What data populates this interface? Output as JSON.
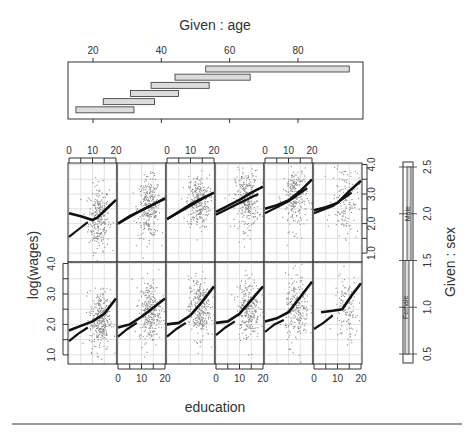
{
  "chart_data": {
    "type": "scatter",
    "subtype": "coplot",
    "title": "",
    "xlabel": "education",
    "ylabel": "log(wages)",
    "xlim": [
      0,
      20
    ],
    "ylim": [
      0.7,
      4.05
    ],
    "x_ticks": [
      0,
      10,
      20
    ],
    "y_ticks": [
      1.0,
      2.0,
      3.0,
      4.0
    ],
    "grid": true,
    "given": [
      {
        "name": "age",
        "label": "Given : age",
        "axis_ticks": [
          20,
          40,
          60,
          80
        ],
        "intervals": [
          [
            15,
            32
          ],
          [
            23,
            38
          ],
          [
            31,
            45
          ],
          [
            37,
            54
          ],
          [
            44,
            66
          ],
          [
            53,
            95
          ]
        ]
      },
      {
        "name": "sex",
        "label": "Given : sex",
        "axis_ticks": [
          0.5,
          1.0,
          1.5,
          2.0,
          2.5
        ],
        "levels": [
          {
            "label": "Female",
            "interval": [
              0.5,
              1.5
            ]
          },
          {
            "label": "Male",
            "interval": [
              1.5,
              2.5
            ]
          }
        ]
      }
    ],
    "panels": [
      {
        "row": "Male",
        "age": [
          15,
          32
        ],
        "cloud": {
          "cx": 12.5,
          "cy": 2.2,
          "sx": 2.2,
          "sy": 0.55,
          "n": 260
        },
        "smooth": [
          [
            0,
            2.35
          ],
          [
            5,
            2.25
          ],
          [
            10,
            2.12
          ],
          [
            12,
            2.2
          ],
          [
            16,
            2.5
          ],
          [
            20,
            2.8
          ]
        ],
        "fit": [
          [
            0,
            1.55
          ],
          [
            4,
            1.8
          ],
          [
            8,
            2.05
          ]
        ]
      },
      {
        "row": "Male",
        "age": [
          23,
          38
        ],
        "cloud": {
          "cx": 13,
          "cy": 2.55,
          "sx": 2.4,
          "sy": 0.5,
          "n": 280
        },
        "smooth": [
          [
            0,
            2.0
          ],
          [
            5,
            2.25
          ],
          [
            10,
            2.45
          ],
          [
            15,
            2.65
          ],
          [
            20,
            2.85
          ]
        ],
        "fit": [
          [
            0,
            2.0
          ],
          [
            10,
            2.45
          ],
          [
            20,
            2.85
          ]
        ]
      },
      {
        "row": "Male",
        "age": [
          31,
          45
        ],
        "cloud": {
          "cx": 13,
          "cy": 2.75,
          "sx": 2.4,
          "sy": 0.45,
          "n": 280
        },
        "smooth": [
          [
            0,
            2.15
          ],
          [
            5,
            2.4
          ],
          [
            10,
            2.65
          ],
          [
            15,
            2.85
          ],
          [
            20,
            3.05
          ]
        ],
        "fit": [
          [
            0,
            2.15
          ],
          [
            10,
            2.6
          ],
          [
            16,
            2.9
          ]
        ]
      },
      {
        "row": "Male",
        "age": [
          37,
          54
        ],
        "cloud": {
          "cx": 13,
          "cy": 2.8,
          "sx": 2.5,
          "sy": 0.5,
          "n": 280
        },
        "smooth": [
          [
            0,
            2.4
          ],
          [
            5,
            2.6
          ],
          [
            10,
            2.8
          ],
          [
            15,
            3.05
          ],
          [
            20,
            3.25
          ]
        ],
        "fit": [
          [
            0,
            2.3
          ],
          [
            10,
            2.7
          ],
          [
            18,
            3.0
          ]
        ]
      },
      {
        "row": "Male",
        "age": [
          44,
          66
        ],
        "cloud": {
          "cx": 12.5,
          "cy": 2.9,
          "sx": 2.6,
          "sy": 0.55,
          "n": 250
        },
        "smooth": [
          [
            0,
            2.5
          ],
          [
            5,
            2.62
          ],
          [
            10,
            2.78
          ],
          [
            15,
            3.1
          ],
          [
            20,
            3.5
          ]
        ],
        "fit": [
          [
            0,
            2.35
          ],
          [
            10,
            2.75
          ],
          [
            18,
            3.2
          ]
        ]
      },
      {
        "row": "Male",
        "age": [
          53,
          95
        ],
        "cloud": {
          "cx": 13,
          "cy": 2.85,
          "sx": 2.8,
          "sy": 0.6,
          "n": 140
        },
        "smooth": [
          [
            0,
            2.45
          ],
          [
            5,
            2.55
          ],
          [
            10,
            2.7
          ],
          [
            15,
            3.1
          ],
          [
            20,
            3.45
          ]
        ],
        "fit": [
          [
            0,
            2.35
          ],
          [
            8,
            2.6
          ],
          [
            16,
            3.05
          ]
        ]
      },
      {
        "row": "Female",
        "age": [
          15,
          32
        ],
        "cloud": {
          "cx": 13,
          "cy": 2.15,
          "sx": 2.2,
          "sy": 0.5,
          "n": 300
        },
        "smooth": [
          [
            0,
            1.8
          ],
          [
            5,
            1.95
          ],
          [
            10,
            2.1
          ],
          [
            15,
            2.35
          ],
          [
            20,
            2.85
          ]
        ],
        "fit": [
          [
            0,
            1.45
          ],
          [
            4,
            1.7
          ],
          [
            8,
            1.9
          ]
        ]
      },
      {
        "row": "Female",
        "age": [
          23,
          38
        ],
        "cloud": {
          "cx": 13.5,
          "cy": 2.45,
          "sx": 2.3,
          "sy": 0.5,
          "n": 290
        },
        "smooth": [
          [
            0,
            1.9
          ],
          [
            5,
            2.0
          ],
          [
            10,
            2.25
          ],
          [
            15,
            2.55
          ],
          [
            20,
            2.85
          ]
        ],
        "fit": [
          [
            0,
            1.6
          ],
          [
            4,
            1.85
          ],
          [
            8,
            2.05
          ]
        ]
      },
      {
        "row": "Female",
        "age": [
          31,
          45
        ],
        "cloud": {
          "cx": 13.5,
          "cy": 2.55,
          "sx": 2.3,
          "sy": 0.5,
          "n": 290
        },
        "smooth": [
          [
            0,
            2.0
          ],
          [
            5,
            2.05
          ],
          [
            10,
            2.3
          ],
          [
            15,
            2.75
          ],
          [
            20,
            3.25
          ]
        ],
        "fit": [
          [
            0,
            1.6
          ],
          [
            4,
            1.85
          ],
          [
            8,
            2.05
          ]
        ]
      },
      {
        "row": "Female",
        "age": [
          37,
          54
        ],
        "cloud": {
          "cx": 13.5,
          "cy": 2.55,
          "sx": 2.4,
          "sy": 0.5,
          "n": 270
        },
        "smooth": [
          [
            0,
            2.05
          ],
          [
            5,
            2.1
          ],
          [
            10,
            2.35
          ],
          [
            15,
            2.8
          ],
          [
            20,
            3.25
          ]
        ],
        "fit": [
          [
            0,
            1.65
          ],
          [
            4,
            1.9
          ],
          [
            8,
            2.1
          ]
        ]
      },
      {
        "row": "Female",
        "age": [
          44,
          66
        ],
        "cloud": {
          "cx": 13.5,
          "cy": 2.5,
          "sx": 2.5,
          "sy": 0.55,
          "n": 230
        },
        "smooth": [
          [
            0,
            2.1
          ],
          [
            5,
            2.2
          ],
          [
            10,
            2.4
          ],
          [
            15,
            2.9
          ],
          [
            20,
            3.4
          ]
        ],
        "fit": [
          [
            0,
            1.75
          ],
          [
            4,
            2.0
          ],
          [
            8,
            2.15
          ]
        ]
      },
      {
        "row": "Female",
        "age": [
          53,
          95
        ],
        "cloud": {
          "cx": 13.5,
          "cy": 2.5,
          "sx": 2.5,
          "sy": 0.55,
          "n": 120
        },
        "smooth": [
          [
            3,
            2.4
          ],
          [
            8,
            2.45
          ],
          [
            12,
            2.5
          ],
          [
            16,
            2.95
          ],
          [
            20,
            3.35
          ]
        ],
        "fit": [
          [
            0,
            1.85
          ],
          [
            4,
            2.05
          ],
          [
            8,
            2.3
          ]
        ]
      }
    ]
  },
  "labels": {
    "given_age": "Given : age",
    "given_sex": "Given : sex",
    "xlabel": "education",
    "ylabel": "log(wages)",
    "male": "Male",
    "female": "Female"
  },
  "colors": {
    "points": "#8a8a8a",
    "lines": "#111111",
    "grid": "#d9d9d9",
    "axis": "#333333",
    "bar_fill": "#dcdcdc",
    "rule": "#777777"
  }
}
